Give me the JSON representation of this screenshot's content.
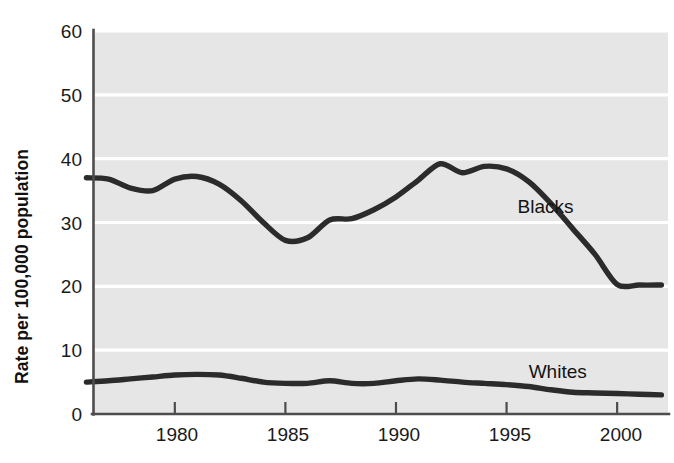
{
  "figure": {
    "background_color": "#ffffff",
    "plot_background_color": "#e6e6e6",
    "gridline_color": "#ffffff",
    "axis_color": "#4d4d4d",
    "line_color": "#2b2b2b"
  },
  "axes": {
    "ylabel": "Rate per 100,000 population",
    "xlabel": "",
    "yticks": [
      "0",
      "10",
      "20",
      "30",
      "40",
      "50",
      "60"
    ],
    "xticks": [
      "1980",
      "1985",
      "1990",
      "1995",
      "2000"
    ]
  },
  "series_labels": {
    "blacks": "Blacks",
    "whites": "Whites"
  },
  "chart_data": {
    "type": "line",
    "title": "",
    "xlabel": "",
    "ylabel": "Rate per 100,000 population",
    "xlim": [
      1976.3,
      2002.3
    ],
    "ylim": [
      0,
      60
    ],
    "xticks": [
      1980,
      1985,
      1990,
      1995,
      2000
    ],
    "yticks": [
      0,
      10,
      20,
      30,
      40,
      50,
      60
    ],
    "grid": "horizontal",
    "legend": "inline-annotation",
    "x": [
      1976,
      1977,
      1978,
      1979,
      1980,
      1981,
      1982,
      1983,
      1984,
      1985,
      1986,
      1987,
      1988,
      1989,
      1990,
      1991,
      1992,
      1993,
      1994,
      1995,
      1996,
      1997,
      1998,
      1999,
      2000,
      2001,
      2002
    ],
    "series": [
      {
        "name": "Blacks",
        "label_position": {
          "x": 1995.5,
          "y": 32.5
        },
        "values": [
          37.0,
          36.8,
          35.4,
          35.0,
          36.8,
          37.2,
          36.0,
          33.4,
          30.0,
          27.2,
          27.6,
          30.4,
          30.6,
          32.0,
          34.0,
          36.6,
          39.2,
          37.8,
          38.8,
          38.4,
          36.4,
          33.0,
          29.0,
          25.0,
          20.3,
          20.2,
          20.2
        ]
      },
      {
        "name": "Whites",
        "label_position": {
          "x": 1996.0,
          "y": 6.6
        },
        "values": [
          5.0,
          5.2,
          5.5,
          5.8,
          6.1,
          6.2,
          6.1,
          5.6,
          5.0,
          4.8,
          4.8,
          5.2,
          4.8,
          4.8,
          5.2,
          5.5,
          5.3,
          5.0,
          4.8,
          4.6,
          4.3,
          3.8,
          3.4,
          3.3,
          3.2,
          3.1,
          3.0
        ]
      }
    ]
  }
}
